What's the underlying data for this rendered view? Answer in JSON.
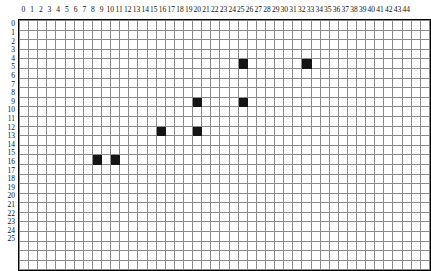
{
  "grid": {
    "columns": 45,
    "rows": 26,
    "cell_width": 8.7,
    "cell_height": 8.6,
    "grid_line_color": "#8a8a8a",
    "border_color": "#000000",
    "background_color": "#ffffff",
    "filled_color": "#151515",
    "column_labels": [
      "0",
      "1",
      "2",
      "3",
      "4",
      "5",
      "6",
      "7",
      "8",
      "9",
      "10",
      "11",
      "12",
      "13",
      "14",
      "15",
      "16",
      "17",
      "18",
      "19",
      "20",
      "21",
      "22",
      "23",
      "24",
      "25",
      "26",
      "27",
      "28",
      "29",
      "30",
      "31",
      "32",
      "33",
      "34",
      "35",
      "36",
      "37",
      "38",
      "39",
      "40",
      "41",
      "42",
      "43",
      "44"
    ],
    "row_labels": [
      "0",
      "1",
      "2",
      "3",
      "4",
      "5",
      "6",
      "7",
      "8",
      "9",
      "10",
      "11",
      "12",
      "13",
      "14",
      "15",
      "16",
      "17",
      "18",
      "19",
      "20",
      "21",
      "22",
      "23",
      "24",
      "25"
    ],
    "filled_cells": [
      {
        "col": 24,
        "row": 4
      },
      {
        "col": 31,
        "row": 4
      },
      {
        "col": 19,
        "row": 8
      },
      {
        "col": 24,
        "row": 8
      },
      {
        "col": 15,
        "row": 11
      },
      {
        "col": 19,
        "row": 11
      },
      {
        "col": 8,
        "row": 14
      },
      {
        "col": 10,
        "row": 14
      }
    ]
  }
}
